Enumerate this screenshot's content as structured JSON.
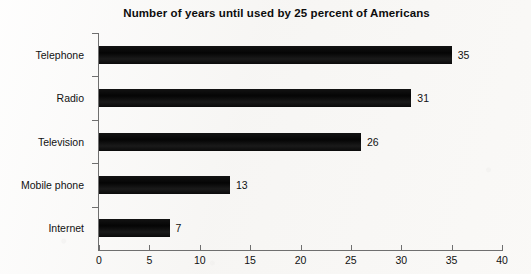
{
  "chart_data": {
    "type": "bar",
    "orientation": "horizontal",
    "title": "Number of years until used by 25 percent of Americans",
    "xlabel": "",
    "ylabel": "",
    "categories": [
      "Telephone",
      "Radio",
      "Television",
      "Mobile phone",
      "Internet"
    ],
    "values": [
      35,
      31,
      26,
      13,
      7
    ],
    "value_labels": [
      "35",
      "31",
      "26",
      "13",
      "7"
    ],
    "xlim": [
      0,
      40
    ],
    "xticks": [
      0,
      5,
      10,
      15,
      20,
      25,
      30,
      35,
      40
    ],
    "xtick_labels": [
      "0",
      "5",
      "10",
      "15",
      "20",
      "25",
      "30",
      "35",
      "40"
    ],
    "grid": false,
    "legend": false,
    "bar_color": "#0a0a0a",
    "axis_color": "#6f6f6f",
    "background_color": "#f7f6f4",
    "text_color": "#111111"
  }
}
